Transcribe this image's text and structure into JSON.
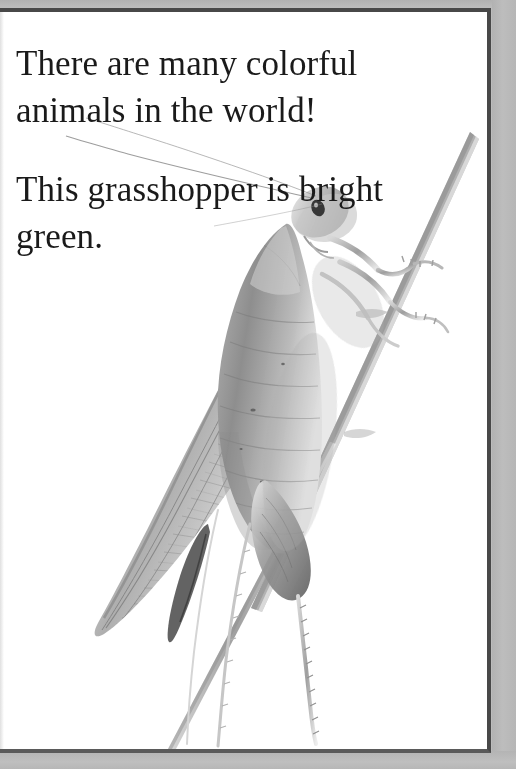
{
  "page": {
    "type": "childrens-book-page",
    "background_color": "#ffffff",
    "surround_color": "#bcbcbc",
    "border_color": "#484848",
    "text_color": "#1a1a1a"
  },
  "content": {
    "paragraphs": [
      "There are many colorful animals in the world!",
      "This grasshopper is bright green."
    ],
    "paragraph_1": "There are many colorful animals in the world!",
    "paragraph_2": "This grasshopper is bright green."
  },
  "photo": {
    "subject": "grasshopper on a plant stem",
    "rendering": "grayscale photograph",
    "parts": {
      "stem": "diagonal-stem",
      "body": "grasshopper-body",
      "wing": "grasshopper-wing",
      "head": "grasshopper-head",
      "eye": "grasshopper-eye",
      "antennae": "grasshopper-antennae",
      "legs": "grasshopper-legs"
    }
  }
}
